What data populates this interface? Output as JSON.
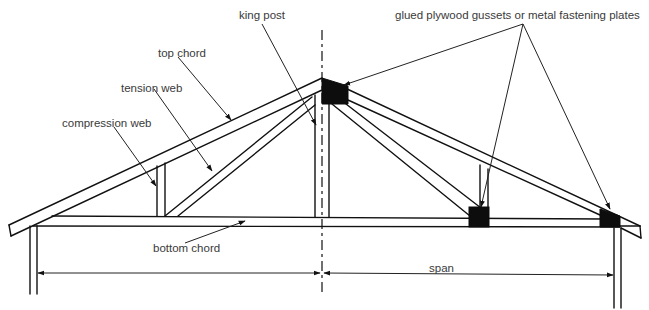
{
  "figure": {
    "labels": {
      "king_post": "king post",
      "top_chord": "top chord",
      "tension_web": "tension web",
      "compression_web": "compression web",
      "gussets": "glued plywood gussets or metal fastening plates",
      "bottom_chord": "bottom chord",
      "span": "span"
    },
    "colors": {
      "line": "#111111",
      "text": "#3a3a3a",
      "gusset": "#0d0d0d",
      "background": "#ffffff"
    }
  }
}
